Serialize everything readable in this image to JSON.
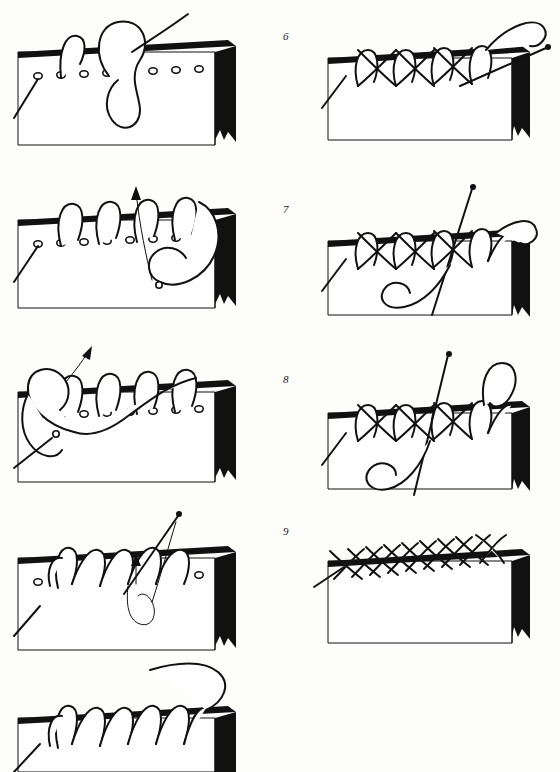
{
  "document": {
    "kind": "technical-illustration",
    "subject": "bookbinding edge-sewing / headband stitch sequence",
    "background_color": "#fdfdfc",
    "ink_color": "#111111",
    "thread_fill_color": "#ffffff",
    "columns": 2,
    "total_steps": 9
  },
  "steps": [
    {
      "id": 1,
      "label": "",
      "column": "left",
      "caption_visible": false,
      "description": "Text block edge in perspective with a row of punched holes; thread forms a large open loop over the edge with the working end exiting to the upper right; needle tail lies at lower left.",
      "holes": 9,
      "loops_over_edge": 1,
      "has_needle": false,
      "has_arrow": false
    },
    {
      "id": 2,
      "label": "",
      "column": "left",
      "caption_visible": false,
      "description": "Five completed loops over the edge; working thread swings down to the right and crosses itself at a small knot dot; an arrow points up and to the right showing the pull direction.",
      "holes": 9,
      "loops_over_edge": 5,
      "has_needle": false,
      "has_arrow": true
    },
    {
      "id": 3,
      "label": "",
      "column": "left",
      "caption_visible": false,
      "description": "Row of loops over the edge with a second pass of thread crossing back over them from the right; needle tail at lower left passes through the first hole; arrow at upper left shows the thread being drawn up.",
      "holes": 9,
      "loops_over_edge": 5,
      "has_needle": false,
      "has_arrow": true
    },
    {
      "id": 4,
      "label": "",
      "column": "left",
      "caption_visible": false,
      "description": "Interlaced zigzag forming along the edge; a straight needle enters from the upper right and dips into a hole, with a small arrow marking the upward pull of the loop.",
      "holes": 9,
      "loops_over_edge": 7,
      "has_needle": true,
      "has_arrow": true
    },
    {
      "id": 5,
      "label": "",
      "column": "left",
      "caption_visible": false,
      "description": "Completed row of interlocking zigzag loops over the whole edge; a long curved thread sweeps away to the upper right.",
      "holes": 0,
      "loops_over_edge": 8,
      "has_needle": false,
      "has_arrow": false
    },
    {
      "id": 6,
      "label": "6",
      "column": "right",
      "caption_visible": true,
      "description": "Cross-stitch chevron pattern worked along the edge; a straight needle lies diagonally across the right-hand end with the thread curving back over the top.",
      "holes": 0,
      "loops_over_edge": 7,
      "has_needle": true,
      "has_arrow": false
    },
    {
      "id": 7,
      "label": "7",
      "column": "right",
      "caption_visible": true,
      "description": "Chevron braid continues; a straight needle stands nearly vertical through the braid at right and the working thread loops down in a large hook below the edge.",
      "holes": 0,
      "loops_over_edge": 8,
      "has_needle": true,
      "has_arrow": false
    },
    {
      "id": 8,
      "label": "8",
      "column": "right",
      "caption_visible": true,
      "description": "Same braid with a standing needle at centre-right; the thread hooks down in a deep loop below the edge and an extra loop rises above the braid at the right.",
      "holes": 0,
      "loops_over_edge": 8,
      "has_needle": true,
      "has_arrow": false
    },
    {
      "id": 9,
      "label": "9",
      "column": "right",
      "caption_visible": true,
      "description": "Finished plaited headband: a dense woven braid covers the full edge, with the starting tail emerging at the far left.",
      "holes": 0,
      "loops_over_edge": 11,
      "has_needle": false,
      "has_arrow": false
    }
  ]
}
